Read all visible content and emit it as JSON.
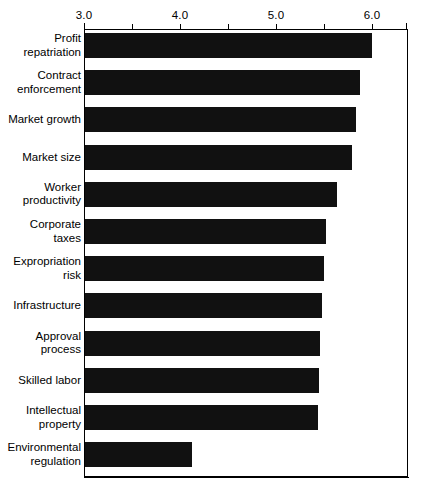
{
  "chart_data": {
    "type": "bar",
    "orientation": "horizontal",
    "title": "",
    "subtitle": "",
    "xlabel": "",
    "ylabel": "",
    "xlim": [
      3.0,
      6.375
    ],
    "axis_position": "top",
    "grid": false,
    "legend": null,
    "bar_color": "#111111",
    "axis_color": "#000000",
    "background_color": "#ffffff",
    "xticks": [
      3.0,
      3.5,
      4.0,
      4.5,
      5.0,
      5.5,
      6.0
    ],
    "xtick_labels": [
      "3.0",
      "",
      "4.0",
      "",
      "5.0",
      "",
      "6.0"
    ],
    "categories": [
      "Profit\nrepatriation",
      "Contract\nenforcement",
      "Market growth",
      "Market size",
      "Worker\nproductivity",
      "Corporate\ntaxes",
      "Expropriation\nrisk",
      "Infrastructure",
      "Approval\nprocess",
      "Skilled labor",
      "Intellectual\nproperty",
      "Environmental\nregulation"
    ],
    "values": [
      6.0,
      5.88,
      5.83,
      5.79,
      5.64,
      5.52,
      5.5,
      5.48,
      5.46,
      5.45,
      5.44,
      4.12
    ]
  }
}
